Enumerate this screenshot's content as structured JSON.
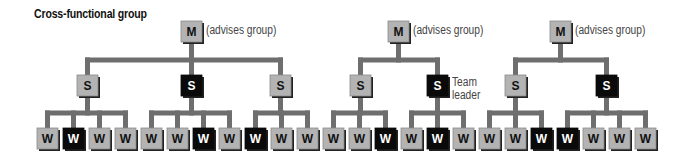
{
  "title": "Cross-functional group",
  "colors": {
    "light": "#b3b3b3",
    "dark": "#0a0a0a",
    "line": "#6e6e6e",
    "shadow": "#222222"
  },
  "groups": [
    {
      "manager": {
        "label": "M",
        "note": "(advises group)",
        "x": 181
      },
      "supervisors": [
        {
          "label": "S",
          "x": 77,
          "dark": false,
          "workers": [
            {
              "label": "W",
              "x": 37,
              "dark": false
            },
            {
              "label": "W",
              "x": 63,
              "dark": true
            },
            {
              "label": "W",
              "x": 89,
              "dark": false
            },
            {
              "label": "W",
              "x": 115,
              "dark": false
            }
          ]
        },
        {
          "label": "S",
          "x": 181,
          "dark": true,
          "workers": [
            {
              "label": "W",
              "x": 141,
              "dark": false
            },
            {
              "label": "W",
              "x": 167,
              "dark": false
            },
            {
              "label": "W",
              "x": 193,
              "dark": true
            },
            {
              "label": "W",
              "x": 219,
              "dark": false
            }
          ]
        },
        {
          "label": "S",
          "x": 270,
          "dark": false,
          "workers": [
            {
              "label": "W",
              "x": 245,
              "dark": true
            },
            {
              "label": "W",
              "x": 271,
              "dark": false
            },
            {
              "label": "W",
              "x": 297,
              "dark": false
            }
          ]
        }
      ]
    },
    {
      "manager": {
        "label": "M",
        "note": "(advises group)",
        "x": 388
      },
      "supervisors": [
        {
          "label": "S",
          "x": 350,
          "dark": false,
          "workers": [
            {
              "label": "W",
              "x": 323,
              "dark": false
            },
            {
              "label": "W",
              "x": 349,
              "dark": false
            },
            {
              "label": "W",
              "x": 375,
              "dark": true
            }
          ]
        },
        {
          "label": "S",
          "x": 427,
          "dark": true,
          "note": "Team leader",
          "workers": [
            {
              "label": "W",
              "x": 401,
              "dark": false
            },
            {
              "label": "W",
              "x": 427,
              "dark": true
            },
            {
              "label": "W",
              "x": 453,
              "dark": false
            }
          ]
        }
      ]
    },
    {
      "manager": {
        "label": "M",
        "note": "(advises group)",
        "x": 550
      },
      "supervisors": [
        {
          "label": "S",
          "x": 505,
          "dark": false,
          "workers": [
            {
              "label": "W",
              "x": 479,
              "dark": false
            },
            {
              "label": "W",
              "x": 505,
              "dark": false
            },
            {
              "label": "W",
              "x": 531,
              "dark": true
            }
          ]
        },
        {
          "label": "S",
          "x": 596,
          "dark": true,
          "workers": [
            {
              "label": "W",
              "x": 557,
              "dark": true
            },
            {
              "label": "W",
              "x": 583,
              "dark": false
            },
            {
              "label": "W",
              "x": 609,
              "dark": false
            },
            {
              "label": "W",
              "x": 635,
              "dark": false
            }
          ]
        }
      ]
    }
  ],
  "notes": {
    "advises_1": "(advises group)",
    "advises_2": "(advises group)",
    "advises_3": "(advises group)",
    "team_leader_line1": "Team",
    "team_leader_line2": "leader"
  }
}
